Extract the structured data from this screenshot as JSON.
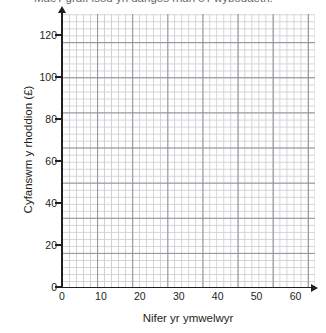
{
  "chart_data": {
    "type": "scatter",
    "title": "Mae'r graff isod yn dangos rhan o'r wybodaeth.",
    "title_clipped": true,
    "xlabel": "Nifer yr ymwelwyr",
    "ylabel": "Cyfanswm y rhoddion (£)",
    "xlim": [
      0,
      65
    ],
    "ylim": [
      0,
      130
    ],
    "xticks": [
      "0",
      "10",
      "20",
      "30",
      "40",
      "50",
      "60"
    ],
    "xtick_values": [
      0,
      10,
      20,
      30,
      40,
      50,
      60
    ],
    "yticks": [
      "0",
      "20",
      "40",
      "60",
      "80",
      "100",
      "120"
    ],
    "ytick_values": [
      0,
      20,
      40,
      60,
      80,
      100,
      120
    ],
    "series": [
      {
        "name": "",
        "x": [],
        "y": []
      }
    ],
    "grid": true,
    "grid_minor": true,
    "grid_major_every": 5,
    "legend": "none",
    "axis_arrows": true,
    "note": "Blank grid — no data plotted"
  },
  "colors": {
    "grid_minor": "#cfcfd4",
    "grid_major": "#8e8e96",
    "axis": "#231f20",
    "text": "#231f20",
    "background": "#ffffff"
  }
}
